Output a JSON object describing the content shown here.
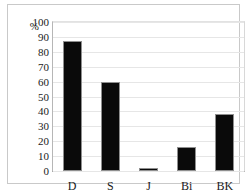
{
  "chart_data": {
    "type": "bar",
    "title": "",
    "subtitle": "",
    "xlabel": "",
    "ylabel": "%",
    "categories": [
      "D",
      "S",
      "J",
      "Bi",
      "BK"
    ],
    "values": [
      87,
      60,
      2,
      16,
      38
    ],
    "series": [
      {
        "name": "",
        "values": [
          87,
          60,
          2,
          16,
          38
        ]
      }
    ],
    "ylim": [
      0,
      100
    ],
    "ytick_step": 10,
    "yticks": [
      0,
      10,
      20,
      30,
      40,
      50,
      60,
      70,
      80,
      90,
      100
    ],
    "ytick_labels": [
      "0",
      "10",
      "20",
      "30",
      "40",
      "50",
      "60",
      "70",
      "80",
      "90",
      "100"
    ],
    "grid": true,
    "grid_axis": "y",
    "legend": false,
    "legend_position": "none",
    "bar_color": "#0a0a0a",
    "bar_border_color": "#8f8f8f",
    "gridline_color": "#e6e6e6",
    "axis_color": "#9a9a9a",
    "frame_color": "#c9c9c9",
    "background_color": "#ffffff",
    "text_color": "#1a1a1a"
  }
}
